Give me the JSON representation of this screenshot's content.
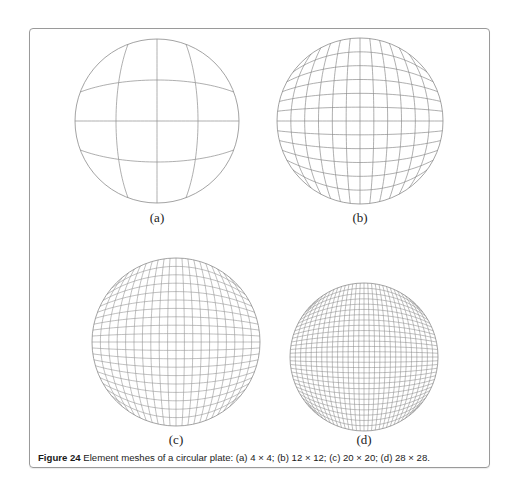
{
  "figure": {
    "number_label": "Figure 24",
    "caption_text": " Element meshes of a circular plate: (a) 4 × 4; (b) 12 × 12; (c) 20 × 20; (d) 28 × 28.",
    "line_color": "#8c8c8c",
    "panels": [
      {
        "id": "a",
        "label": "(a)",
        "mesh": "4 × 4",
        "divisions": 4,
        "cx": 157,
        "cy": 121,
        "r": 82,
        "label_x": 157,
        "label_y": 210
      },
      {
        "id": "b",
        "label": "(b)",
        "mesh": "12 × 12",
        "divisions": 12,
        "cx": 360,
        "cy": 121,
        "r": 83,
        "label_x": 360,
        "label_y": 210
      },
      {
        "id": "c",
        "label": "(c)",
        "mesh": "20 × 20",
        "divisions": 20,
        "cx": 176,
        "cy": 342,
        "r": 84,
        "label_x": 176,
        "label_y": 432
      },
      {
        "id": "d",
        "label": "(d)",
        "mesh": "28 × 28",
        "divisions": 28,
        "cx": 364,
        "cy": 357,
        "r": 74,
        "label_x": 364,
        "label_y": 432
      }
    ]
  }
}
